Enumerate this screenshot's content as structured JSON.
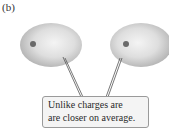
{
  "figure": {
    "panel_label": "(b)",
    "callout": {
      "lines": [
        "Unlike charges are",
        "are closer on average."
      ]
    },
    "left_cloud": {
      "shape": "electron-cloud",
      "nucleus": "nucleus-dot"
    },
    "right_cloud": {
      "shape": "electron-cloud",
      "nucleus": "nucleus-dot"
    },
    "colors": {
      "cloud_center": "#f2f2f2",
      "cloud_edge": "#b4b4b4",
      "nucleus": "#6a6a6a",
      "leader_line": "#555555",
      "callout_fill": "#f4f4f4",
      "callout_border": "#9a9a9a"
    }
  }
}
